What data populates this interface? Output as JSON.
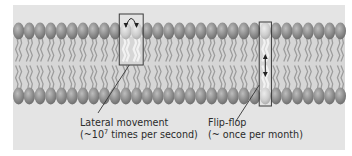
{
  "figure": {
    "colors": {
      "background": "#e4e4e4",
      "head": "#8c8c8c",
      "head_highlight": "#b9b9b9",
      "highlighted_head": "#cfcfcf",
      "tail": "#a8a8a8",
      "core": "#d8d8d8",
      "box": "#3a3a3a",
      "text": "#2b2b2b"
    },
    "bilayer": {
      "lipids_per_leaflet": 31,
      "leaflets": [
        "outer",
        "inner"
      ]
    },
    "annotations": [
      {
        "id": "lateral",
        "name": "Lateral movement",
        "line1": "Lateral movement",
        "line2_prefix": "(~10",
        "line2_superscript": "7",
        "line2_suffix": " times per second)",
        "arrow": "curved-swap",
        "highlighted_lipids": [
          10,
          11
        ],
        "leaflet": "outer"
      },
      {
        "id": "flipflop",
        "name": "Flip-flop",
        "line1": "Flip-flop",
        "line2": "(~ once per month)",
        "arrow": "vertical-double",
        "highlighted_lipids": [
          23
        ],
        "leaflet": "both"
      }
    ]
  }
}
